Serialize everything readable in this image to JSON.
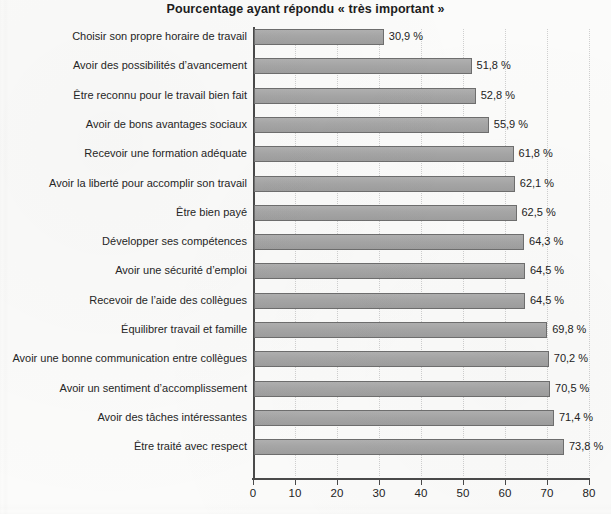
{
  "chart_data": {
    "type": "bar",
    "orientation": "horizontal",
    "title": "Pourcentage ayant répondu « très important »",
    "xlabel": "",
    "ylabel": "",
    "xlim": [
      0,
      80
    ],
    "xticks": [
      0,
      10,
      20,
      30,
      40,
      50,
      60,
      70,
      80
    ],
    "xtick_labels": [
      "0",
      "10",
      "20",
      "30",
      "40",
      "50",
      "60",
      "70",
      "80"
    ],
    "grid": true,
    "grid_axis": "x",
    "legend": false,
    "value_suffix": " %",
    "decimal_separator": ",",
    "categories": [
      "Choisir son propre horaire de travail",
      "Avoir des possibilités d’avancement",
      "Être reconnu pour le travail bien fait",
      "Avoir de bons avantages sociaux",
      "Recevoir une formation adéquate",
      "Avoir la liberté pour accomplir son travail",
      "Être bien payé",
      "Développer ses compétences",
      "Avoir une sécurité d’emploi",
      "Recevoir de l’aide des collègues",
      "Équilibrer travail et famille",
      "Avoir une bonne communication entre collègues",
      "Avoir un sentiment d’accomplissement",
      "Avoir des tâches intéressantes",
      "Être traité avec respect"
    ],
    "values": [
      30.9,
      51.8,
      52.8,
      55.9,
      61.8,
      62.1,
      62.5,
      64.3,
      64.5,
      64.5,
      69.8,
      70.2,
      70.5,
      71.4,
      73.8
    ],
    "value_labels": [
      "30,9 %",
      "51,8 %",
      "52,8 %",
      "55,9 %",
      "61,8 %",
      "62,1 %",
      "62,5 %",
      "64,3 %",
      "64,5 %",
      "64,5 %",
      "69,8 %",
      "70,2 %",
      "70,5 %",
      "71,4 %",
      "73,8 %"
    ],
    "colors": {
      "bar_fill": "#a6a6a6",
      "bar_border": "#6e6e6e",
      "axis": "#4a4a4a",
      "gridline": "#cfcfcf",
      "background": "#fbfbfa",
      "text": "#232323"
    }
  }
}
